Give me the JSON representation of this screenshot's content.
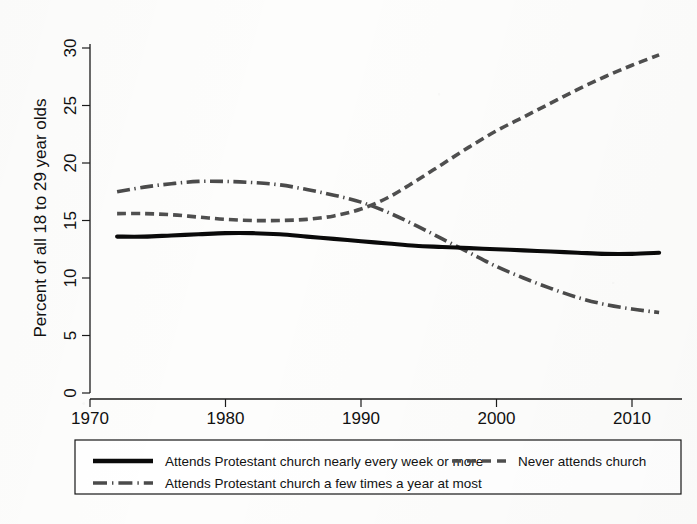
{
  "chart_data": {
    "type": "line",
    "title": "",
    "subtitle": "",
    "xlabel": "",
    "ylabel": "Percent of all 18 to 29 year olds",
    "xlim": [
      1970,
      2013
    ],
    "ylim": [
      0,
      31
    ],
    "grid": false,
    "legend_position": "bottom",
    "x_ticks": [
      "1970",
      "1980",
      "1990",
      "2000",
      "2010"
    ],
    "x_tick_values": [
      1970,
      1980,
      1990,
      2000,
      2010
    ],
    "y_ticks": [
      "0",
      "5",
      "10",
      "15",
      "20",
      "25",
      "30"
    ],
    "y_tick_values": [
      0,
      5,
      10,
      15,
      20,
      25,
      30
    ],
    "x": [
      1972,
      1974,
      1976,
      1978,
      1980,
      1982,
      1984,
      1986,
      1988,
      1990,
      1992,
      1994,
      1996,
      1998,
      2000,
      2002,
      2004,
      2006,
      2008,
      2010,
      2012
    ],
    "series": [
      {
        "name": "Attends Protestant church nearly every week or more",
        "style": "solid",
        "color": "#0a0a0a",
        "values": [
          13.6,
          13.6,
          13.7,
          13.8,
          13.9,
          13.9,
          13.8,
          13.6,
          13.4,
          13.2,
          13.0,
          12.8,
          12.7,
          12.6,
          12.5,
          12.4,
          12.3,
          12.2,
          12.1,
          12.1,
          12.2
        ]
      },
      {
        "name": "Attends Protestant church a few times a year at most",
        "style": "long-dash",
        "color": "#4b4b4b",
        "values": [
          17.5,
          17.9,
          18.2,
          18.4,
          18.4,
          18.3,
          18.1,
          17.7,
          17.2,
          16.6,
          15.7,
          14.6,
          13.4,
          12.2,
          11.0,
          10.0,
          9.1,
          8.3,
          7.7,
          7.3,
          7.0
        ]
      },
      {
        "name": "Never attends church",
        "style": "short-dash",
        "color": "#4f4f4f",
        "values": [
          15.6,
          15.6,
          15.5,
          15.3,
          15.1,
          15.0,
          15.0,
          15.1,
          15.4,
          16.0,
          17.0,
          18.4,
          19.9,
          21.4,
          22.8,
          24.0,
          25.2,
          26.4,
          27.5,
          28.5,
          29.4
        ]
      }
    ],
    "legend_entries": [
      {
        "label": "Attends Protestant church nearly every week or more",
        "style": "solid"
      },
      {
        "label": "Never attends church",
        "style": "short-dash"
      },
      {
        "label": "Attends Protestant church a few times a year at most",
        "style": "long-dash"
      }
    ]
  }
}
